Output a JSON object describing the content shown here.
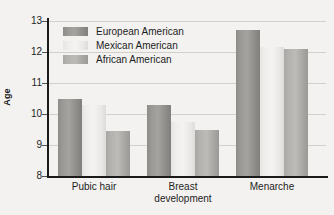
{
  "chart_data": {
    "type": "bar",
    "title": "",
    "xlabel": "",
    "ylabel": "Age",
    "ylim": [
      8,
      13
    ],
    "yticks": [
      8,
      9,
      10,
      11,
      12,
      13
    ],
    "grid": true,
    "legend_position": "top-left-inside",
    "categories": [
      "Pubic hair",
      "Breast development",
      "Menarche"
    ],
    "category_lines": [
      [
        "Pubic hair"
      ],
      [
        "Breast",
        "development"
      ],
      [
        "Menarche"
      ]
    ],
    "series": [
      {
        "name": "European American",
        "color": "#9a9895",
        "values": [
          10.5,
          10.3,
          12.7
        ]
      },
      {
        "name": "Mexican American",
        "color": "#efeeec",
        "values": [
          10.3,
          9.75,
          12.15
        ]
      },
      {
        "name": "African American",
        "color": "#b4b2af",
        "values": [
          9.45,
          9.5,
          12.1
        ]
      }
    ]
  },
  "axis": {
    "y_title": "Age",
    "tick_labels": [
      "8",
      "9",
      "10",
      "11",
      "12",
      "13"
    ]
  },
  "legend": {
    "items": [
      {
        "label": "European American"
      },
      {
        "label": "Mexican American"
      },
      {
        "label": "African American"
      }
    ]
  },
  "colors": {
    "background": "#f3f2f0",
    "axis": "#1a1a1a",
    "gridline": "#d2d0cd",
    "text": "#1d1d1d"
  }
}
